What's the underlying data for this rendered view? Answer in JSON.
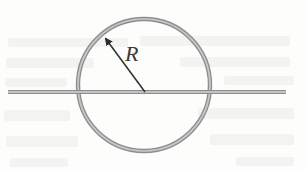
{
  "figure": {
    "caption_alt": "A circular conducting loop of radius R with a straight horizontal wire passing through its center",
    "background_color": "#fdfdfc",
    "canvas": {
      "width": 307,
      "height": 170
    }
  },
  "labels": {
    "radius": "R"
  },
  "geometry": {
    "loop": {
      "center_x": 144,
      "center_y": 85,
      "radius": 66,
      "stroke_color": "#8e8e8e",
      "stroke_width": 4.4,
      "core_color": "#c9c9c9"
    },
    "wire": {
      "x_start": 8,
      "x_end": 286,
      "y": 92,
      "stroke_color": "#8d8d8d",
      "thickness": 4.2
    },
    "radius_arrow": {
      "tail_x": 145,
      "tail_y": 92,
      "tip_x": 103,
      "tip_y": 35,
      "color": "#2e2e2e",
      "stroke_width": 1.5
    },
    "radius_label_position": {
      "x": 125,
      "y": 43
    }
  },
  "ghost_text_bands": [
    {
      "x": 8,
      "y": 38,
      "w": 120,
      "h": 9
    },
    {
      "x": 140,
      "y": 36,
      "w": 150,
      "h": 10
    },
    {
      "x": 6,
      "y": 58,
      "w": 88,
      "h": 10
    },
    {
      "x": 180,
      "y": 57,
      "w": 110,
      "h": 10
    },
    {
      "x": 5,
      "y": 78,
      "w": 62,
      "h": 9
    },
    {
      "x": 224,
      "y": 76,
      "w": 70,
      "h": 9
    },
    {
      "x": 4,
      "y": 110,
      "w": 66,
      "h": 11
    },
    {
      "x": 198,
      "y": 108,
      "w": 96,
      "h": 11
    },
    {
      "x": 6,
      "y": 136,
      "w": 72,
      "h": 11
    },
    {
      "x": 210,
      "y": 134,
      "w": 84,
      "h": 11
    },
    {
      "x": 10,
      "y": 158,
      "w": 58,
      "h": 9
    },
    {
      "x": 236,
      "y": 157,
      "w": 58,
      "h": 9
    }
  ]
}
